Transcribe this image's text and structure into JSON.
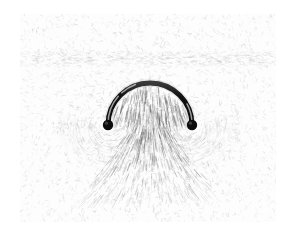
{
  "figure": {
    "kind": "photograph",
    "caption": "",
    "page_background": "#ffffff"
  },
  "plate": {
    "name": "iron-filings-plate",
    "x": 20,
    "y": 14,
    "width": 256,
    "height": 208,
    "paper_color": "#fdfdfd",
    "filings_color": "#7d7d7d",
    "filings_dark_color": "#4a4a4a",
    "band": {
      "present": true,
      "y_center": 45,
      "height": 16,
      "note": "faint horizontal denser band of filings across upper plate"
    }
  },
  "conductor": {
    "name": "semicircular-wire-loop",
    "shape": "semicircle-arc",
    "color": "#111111",
    "highlight_color": "#d8d8d8",
    "stroke_width": 5.0,
    "center_x": 130,
    "center_y": 111,
    "radius": 42,
    "apex_y": 81,
    "left_end_x": 88,
    "left_end_y": 111,
    "right_end_x": 172,
    "right_end_y": 111,
    "terminals": [
      {
        "name": "left-terminal-post",
        "cx": 88,
        "cy": 111,
        "r": 5.2,
        "color": "#0d0d0d"
      },
      {
        "name": "right-terminal-post",
        "cx": 172,
        "cy": 111,
        "r": 5.2,
        "color": "#0d0d0d"
      }
    ]
  },
  "field": {
    "name": "magnetic-field-pattern",
    "description": "Filings align into radiating streaks inside and below the loop and into circular whorls around each terminal post.",
    "interior_streaks": 46,
    "below_fan_streaks": 58,
    "whorl_rings_per_terminal": 5,
    "background_speckle_count": 2600
  },
  "labels": {
    "title": "",
    "source_note": ""
  }
}
